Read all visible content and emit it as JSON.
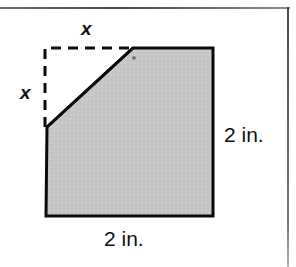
{
  "figure": {
    "colors": {
      "shaded_fill": "#c7c7c7",
      "outline": "#000000",
      "dashed_outline": "#000000",
      "frame_rule": "#4a4a4a",
      "label_text": "#111111",
      "background": "#ffffff"
    },
    "labels": {
      "x_top": "x",
      "x_left": "x",
      "right_side": "2 in.",
      "bottom_side": "2 in."
    },
    "geometry": {
      "square_side_label": "2 in.",
      "cut_side_label": "x",
      "shaded_polygon_points": "47,127 133,48 213,48 213,216 46,216",
      "dashed_rect": {
        "x": 45,
        "y": 48,
        "width": 88,
        "height": 79
      },
      "diagonal_line": {
        "x1": 47,
        "y1": 127,
        "x2": 133,
        "y2": 48
      },
      "corner_tick": {
        "x": 133,
        "y": 58
      }
    }
  }
}
